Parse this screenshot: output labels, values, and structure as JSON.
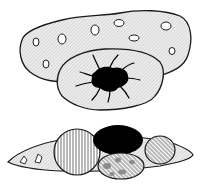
{
  "figure": {
    "colors": {
      "background": "#ffffff",
      "outline": "#1a1a1a",
      "fill_gray": "#e6e6e6",
      "dark": "#000000",
      "spot": "#8c8c8c"
    },
    "top_cell": {
      "label": "",
      "outer_body": "hatched irregular blob with small vacuoles",
      "inner_body": "hatched lobe with black star-shaped core"
    },
    "bottom_cell": {
      "label": "",
      "body": "spindle shape",
      "inclusions": [
        "vertical-striped circle",
        "black oval",
        "diagonal-striped circle",
        "spotted oval"
      ]
    }
  }
}
